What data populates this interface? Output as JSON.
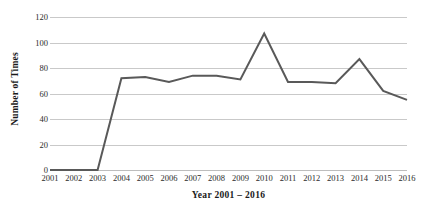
{
  "chart_data": {
    "type": "line",
    "title": "",
    "subtitle": "",
    "xlabel": "Year 2001 – 2016",
    "ylabel": "Number of Times",
    "categories": [
      "2001",
      "2002",
      "2003",
      "2004",
      "2005",
      "2006",
      "2007",
      "2008",
      "2009",
      "2010",
      "2011",
      "2012",
      "2013",
      "2014",
      "2015",
      "2016"
    ],
    "values": [
      0,
      0,
      0,
      72,
      73,
      69,
      74,
      74,
      71,
      107,
      69,
      69,
      68,
      87,
      62,
      55
    ],
    "series": [
      {
        "name": "Number of Times",
        "values": [
          0,
          0,
          0,
          72,
          73,
          69,
          74,
          74,
          71,
          107,
          69,
          69,
          68,
          87,
          62,
          55
        ]
      }
    ],
    "ylim": [
      0,
      120
    ],
    "yticks": [
      0,
      20,
      40,
      60,
      80,
      100,
      120
    ],
    "ytick_labels": [
      "0",
      "20",
      "40",
      "60",
      "80",
      "100",
      "120"
    ],
    "xlim_categories": [
      "2001",
      "2016"
    ],
    "grid": "horizontal",
    "legend": "none",
    "line_color": "#595959",
    "grid_color": "#c9c9c9",
    "background_color": "#ffffff",
    "text_color": "#2b2b2b",
    "annotations": []
  }
}
